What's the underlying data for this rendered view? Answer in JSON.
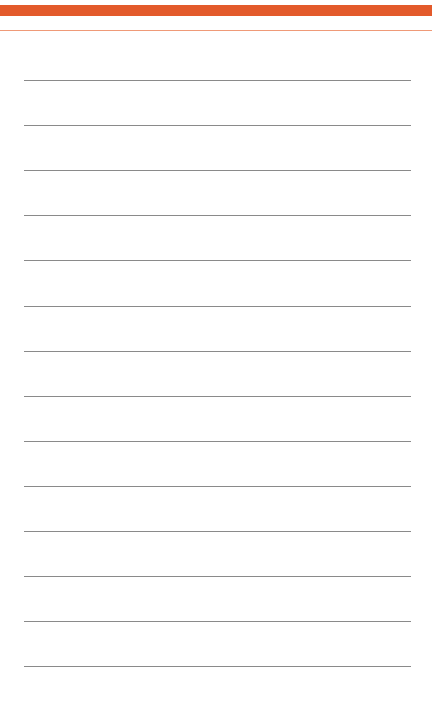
{
  "page": {
    "type": "blank-lined-notepad",
    "background_color": "#ffffff"
  },
  "header": {
    "bar_color": "#e35a2b",
    "rule_color": "#ef9a78"
  },
  "ruled_lines": {
    "color": "#8a8a8a",
    "count": 14,
    "left": 24,
    "width": 387,
    "positions_y": [
      80,
      125,
      170,
      215,
      260,
      306,
      351,
      396,
      441,
      486,
      531,
      576,
      621,
      666
    ]
  }
}
